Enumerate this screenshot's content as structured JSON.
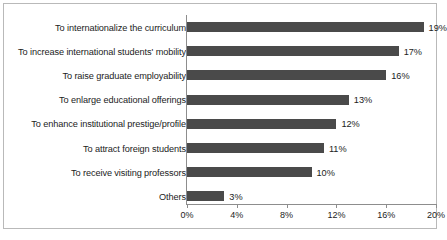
{
  "chart_data": {
    "type": "bar",
    "orientation": "horizontal",
    "title": "",
    "xlabel": "",
    "ylabel": "",
    "xlim": [
      0,
      20
    ],
    "xticks": [
      "0%",
      "4%",
      "8%",
      "12%",
      "16%",
      "20%"
    ],
    "xtick_values": [
      0,
      4,
      8,
      12,
      16,
      20
    ],
    "grid": false,
    "legend": false,
    "bar_color": "#4a4a4a",
    "axis_color": "#8d8d8d",
    "frame_color": "#b9b9b9",
    "categories": [
      "To internationalize the curriculum",
      "To increase international students' mobility",
      "To raise graduate employability",
      "To enlarge educational offerings",
      "To enhance institutional prestige/profile",
      "To attract foreign students",
      "To receive visiting professors",
      "Others"
    ],
    "values": [
      19,
      17,
      16,
      13,
      12,
      11,
      10,
      3
    ],
    "data_labels": [
      "19%",
      "17%",
      "16%",
      "13%",
      "12%",
      "11%",
      "10%",
      "3%"
    ]
  },
  "caption": {
    "text": ""
  }
}
